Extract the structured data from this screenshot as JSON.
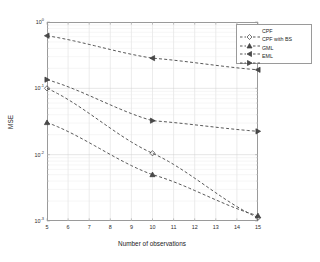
{
  "chart_data": {
    "type": "line",
    "title": "",
    "xlabel": "Number of observations",
    "ylabel": "MSE",
    "xscale": "linear",
    "yscale": "log",
    "xlim": [
      5,
      15
    ],
    "ylim": [
      0.001,
      1
    ],
    "grid": true,
    "grid_color": "#d8d8d8",
    "background": "#ffffff",
    "axis_color": "#9a9a9a",
    "line_style": "dashed",
    "line_color": "#3a3a3a",
    "legend_position": "top-right",
    "xticks": [
      5,
      6,
      7,
      8,
      9,
      10,
      11,
      12,
      13,
      14,
      15
    ],
    "xticklabels": [
      "5",
      "6",
      "7",
      "8",
      "9",
      "10",
      "11",
      "12",
      "13",
      "14",
      "15"
    ],
    "yticks": [
      1,
      0.1,
      0.01,
      0.001
    ],
    "yticklabels": [
      "10",
      "10",
      "10",
      "10"
    ],
    "ytickexponents": [
      "0",
      "-1",
      "-2",
      "-3"
    ],
    "x": [
      5,
      10,
      15
    ],
    "series": [
      {
        "name": "CPF",
        "marker": "diamond",
        "values": [
          0.1,
          0.0105,
          0.00112
        ]
      },
      {
        "name": "CPF with BS",
        "marker": "triangle-up",
        "values": [
          0.0305,
          0.005,
          0.0012
        ]
      },
      {
        "name": "GML",
        "marker": "triangle-left",
        "values": [
          0.62,
          0.285,
          0.19
        ]
      },
      {
        "name": "EML",
        "marker": "triangle-right",
        "values": [
          0.135,
          0.0325,
          0.0225
        ]
      }
    ]
  },
  "legend": {
    "entries": [
      {
        "label": "CPF"
      },
      {
        "label": "CPF with BS"
      },
      {
        "label": "GML"
      },
      {
        "label": "EML"
      }
    ]
  }
}
